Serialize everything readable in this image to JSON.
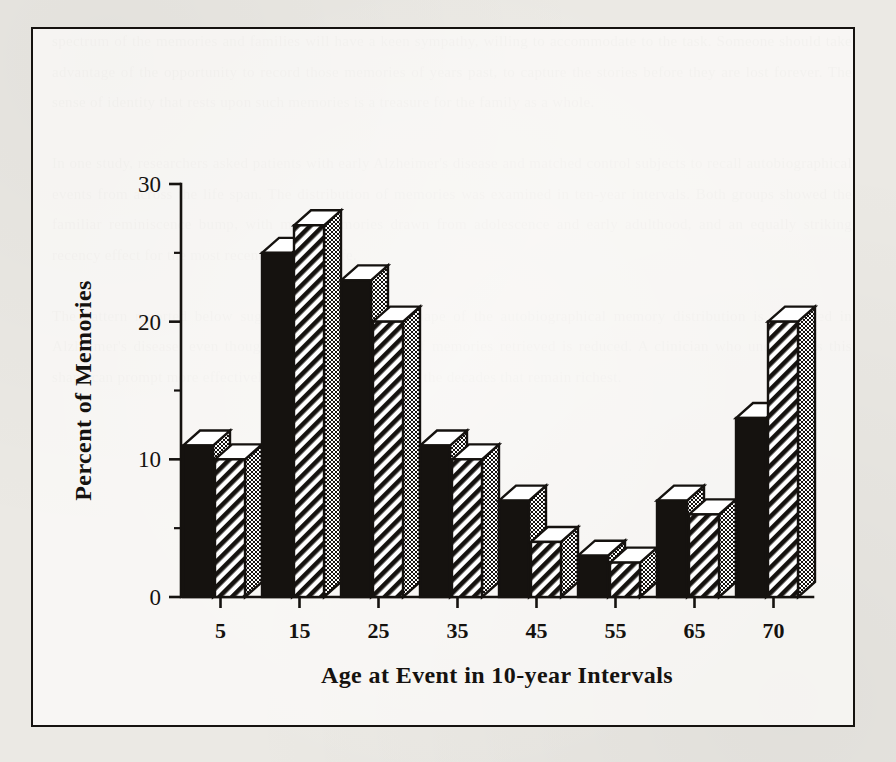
{
  "figure": {
    "frame_border_color": "#15120f",
    "page_background": "#ebe9e4"
  },
  "legend": {
    "position": "top-center",
    "entries": [
      {
        "label": "Controls",
        "swatch": "solid-black",
        "color": "#15120f"
      },
      {
        "label": "Alzheimer's",
        "swatch": "diagonal-hatch",
        "color": "#15120f"
      }
    ]
  },
  "background_text": "spectrum of the memories and families will have a keen sympathy, willing to accommodate to the task. Someone should take advantage of the opportunity to record those memories of years past, to capture the stories before they are lost forever. The sense of identity that rests upon such memories is a treasure for the family as a whole.\n\nIn one study, researchers asked patients with early Alzheimer's disease and matched control subjects to recall autobiographical events from across the life span. The distribution of memories was examined in ten-year intervals. Both groups showed the familiar reminiscence bump, with many memories drawn from adolescence and early adulthood, and an equally striking recency effect for the most recent decade of life.\n\nThe pattern reported below suggests that the overall shape of the autobiographical memory distribution is preserved in Alzheimer's disease, even though the absolute number of memories retrieved is reduced. A clinician who understands this shape can prompt more effectively, anchoring questions in the decades that remain richest.",
  "chart_data": {
    "type": "bar",
    "title": "",
    "xlabel": "Age at Event in 10-year Intervals",
    "ylabel": "Percent of Memories",
    "categories": [
      "5",
      "15",
      "25",
      "35",
      "45",
      "55",
      "65",
      "70"
    ],
    "series": [
      {
        "name": "Controls",
        "values": [
          11,
          25,
          23,
          11,
          7,
          3,
          7,
          13
        ]
      },
      {
        "name": "Alzheimer's",
        "values": [
          10,
          27,
          20,
          10,
          4,
          2.5,
          6,
          20
        ]
      }
    ],
    "ylim": [
      0,
      30
    ],
    "ytick_labels": [
      "0",
      "10",
      "20",
      "30"
    ],
    "ytick_values": [
      0,
      10,
      20,
      30
    ],
    "yminor_values": [
      5,
      15,
      25
    ],
    "xtick_labels": [
      "5",
      "15",
      "25",
      "35",
      "45",
      "55",
      "65",
      "70"
    ],
    "grid": false,
    "legend_position": "top-center",
    "style": "3d-bars"
  }
}
